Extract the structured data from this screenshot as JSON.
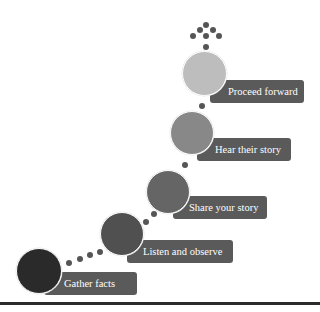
{
  "diagram": {
    "type": "ascending-steps",
    "steps": [
      {
        "order": 1,
        "label": "Gather facts",
        "circle_color": "#2a2a2a"
      },
      {
        "order": 2,
        "label": "Listen and observe",
        "circle_color": "#505050"
      },
      {
        "order": 3,
        "label": "Share your story",
        "circle_color": "#656565"
      },
      {
        "order": 4,
        "label": "Hear their story",
        "circle_color": "#888888"
      },
      {
        "order": 5,
        "label": "Proceed forward",
        "circle_color": "#bdbdbd"
      }
    ],
    "label_color": "#5a5a5a",
    "connector_dot_color": "#555555"
  }
}
